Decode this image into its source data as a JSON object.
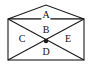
{
  "figure": {
    "stroke_color": "#1a1a1a",
    "fill_color": "#ffffff",
    "background_color": "#ffffff",
    "label_color": "#111111",
    "stroke_width": 1.1,
    "vertices": {
      "apex": {
        "name": "apex-top",
        "x": 46,
        "y": 5
      },
      "top_left": {
        "name": "corner-top-left",
        "x": 8,
        "y": 19
      },
      "top_right": {
        "name": "corner-top-right",
        "x": 84,
        "y": 19
      },
      "bottom_left": {
        "name": "corner-bottom-left",
        "x": 8,
        "y": 60
      },
      "bottom_right": {
        "name": "corner-bottom-right",
        "x": 84,
        "y": 60
      },
      "center": {
        "name": "diagonal-intersection",
        "x": 46,
        "y": 41
      }
    },
    "center_dot": {
      "name": "center-point-dot",
      "x": 46,
      "y": 41,
      "radius": 2.2,
      "color": "#1a1a1a"
    },
    "edges": [
      {
        "name": "roof-left-edge",
        "from": "top_left",
        "to": "apex"
      },
      {
        "name": "roof-right-edge",
        "from": "apex",
        "to": "top_right"
      },
      {
        "name": "eaves-horizontal-edge",
        "from": "top_left",
        "to": "top_right"
      },
      {
        "name": "left-side-edge",
        "from": "top_left",
        "to": "bottom_left"
      },
      {
        "name": "right-side-edge",
        "from": "top_right",
        "to": "bottom_right"
      },
      {
        "name": "bottom-edge",
        "from": "bottom_left",
        "to": "bottom_right"
      },
      {
        "name": "diagonal-top-left-to-bottom-right",
        "from": "top_left",
        "to": "bottom_right"
      },
      {
        "name": "diagonal-top-right-to-bottom-left",
        "from": "top_right",
        "to": "bottom_left"
      }
    ],
    "labels": [
      {
        "id": "A",
        "text": "A",
        "x": 46,
        "y": 15,
        "region": "roof-triangle"
      },
      {
        "id": "B",
        "text": "B",
        "x": 46,
        "y": 30,
        "region": "upper-triangle"
      },
      {
        "id": "C",
        "text": "C",
        "x": 22,
        "y": 39,
        "region": "left-triangle"
      },
      {
        "id": "D",
        "text": "D",
        "x": 46,
        "y": 52,
        "region": "lower-triangle"
      },
      {
        "id": "E",
        "text": "E",
        "x": 68,
        "y": 39,
        "region": "right-triangle"
      }
    ]
  }
}
